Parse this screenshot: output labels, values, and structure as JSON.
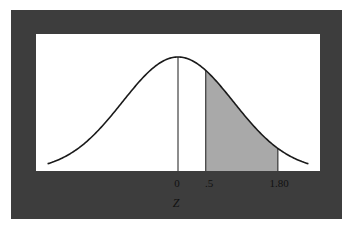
{
  "diagram": {
    "type": "normal-distribution-curve",
    "shaded_region": {
      "from": 0.5,
      "to": 1.8,
      "color": "#a9a9a9"
    },
    "colors": {
      "frame": "#3d3d3d",
      "panel": "#ffffff",
      "curve": "#1a1a1a"
    },
    "tick_labels": [
      {
        "label": "0",
        "value": 0
      },
      {
        "label": ".5",
        "value": 0.5
      },
      {
        "label": "1.80",
        "value": 1.8
      }
    ],
    "axis_title": "Z"
  }
}
